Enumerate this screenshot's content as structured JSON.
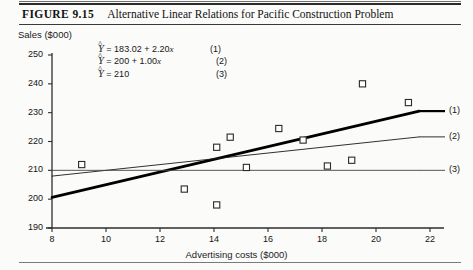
{
  "figure": {
    "number_label": "FIGURE 9.15",
    "caption": "Alternative Linear Relations for Pacific Construction Problem"
  },
  "axis_titles": {
    "y": "Sales ($000)",
    "x": "Advertising costs ($000)"
  },
  "equations": [
    {
      "lhs": "Y",
      "rhs": "= 183.02 + 2.20",
      "xvar": "x",
      "tail": "",
      "number": "(1)"
    },
    {
      "lhs": "Y",
      "rhs": "= 200 + 1.00",
      "xvar": "x",
      "tail": "",
      "number": "(2)"
    },
    {
      "lhs": "Y",
      "rhs": "= 210",
      "xvar": "",
      "tail": "",
      "number": "(3)"
    }
  ],
  "line_end_labels": {
    "one": "(1)",
    "two": "(2)",
    "three": "(3)"
  },
  "chart_data": {
    "type": "scatter",
    "title": "Alternative Linear Relations for Pacific Construction Problem",
    "xlabel": "Advertising costs ($000)",
    "ylabel": "Sales ($000)",
    "xlim": [
      8,
      22
    ],
    "ylim": [
      190,
      250
    ],
    "xticks": [
      8,
      10,
      12,
      14,
      16,
      18,
      20,
      22
    ],
    "yticks": [
      190,
      200,
      210,
      220,
      230,
      240,
      250
    ],
    "xtick_labels": [
      "8",
      "10",
      "12",
      "14",
      "16",
      "18",
      "20",
      "22"
    ],
    "ytick_labels": [
      "190",
      "200",
      "210",
      "220",
      "230",
      "240",
      "250"
    ],
    "grid": false,
    "legend": "line-end-labels",
    "marker": "open-square",
    "points": [
      {
        "x": 9.1,
        "y": 212.0
      },
      {
        "x": 12.9,
        "y": 203.5
      },
      {
        "x": 14.1,
        "y": 218.0
      },
      {
        "x": 14.1,
        "y": 198.0
      },
      {
        "x": 14.6,
        "y": 221.5
      },
      {
        "x": 15.2,
        "y": 211.0
      },
      {
        "x": 16.4,
        "y": 224.5
      },
      {
        "x": 17.3,
        "y": 220.5
      },
      {
        "x": 18.2,
        "y": 211.5
      },
      {
        "x": 19.1,
        "y": 213.5
      },
      {
        "x": 19.5,
        "y": 240.0
      },
      {
        "x": 21.2,
        "y": 233.5
      }
    ],
    "series": [
      {
        "name": "(1)",
        "equation": "Yhat = 183.02 + 2.20x",
        "intercept": 183.02,
        "slope": 2.2,
        "style": "thick",
        "color": "#000000",
        "endpoints": [
          {
            "x": 8,
            "y": 200.62
          },
          {
            "x": 21.6,
            "y": 230.54
          }
        ]
      },
      {
        "name": "(2)",
        "equation": "Yhat = 200 + 1.00x",
        "intercept": 200,
        "slope": 1.0,
        "style": "thin",
        "color": "#1a1a1a",
        "endpoints": [
          {
            "x": 8,
            "y": 208.0
          },
          {
            "x": 21.6,
            "y": 221.6
          }
        ]
      },
      {
        "name": "(3)",
        "equation": "Yhat = 210",
        "intercept": 210,
        "slope": 0.0,
        "style": "thin",
        "color": "#444444",
        "endpoints": [
          {
            "x": 8,
            "y": 210.0
          },
          {
            "x": 21.6,
            "y": 210.0
          }
        ]
      }
    ]
  }
}
